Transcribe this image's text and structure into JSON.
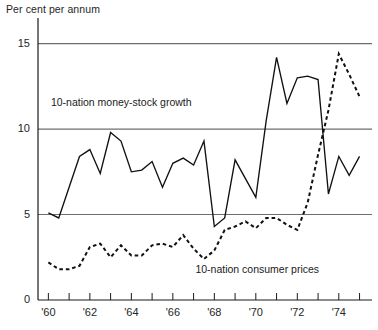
{
  "chart_data": {
    "type": "line",
    "title": "",
    "ylabel": "Per cent per annum",
    "xlabel": "",
    "ylim": [
      0,
      16.5
    ],
    "xlim": [
      1959.5,
      1975.6
    ],
    "grid": "horizontal gridlines at 5, 10, 15",
    "yticks": [
      0,
      5,
      10,
      15
    ],
    "yticklabels": [
      "0",
      "5",
      "10",
      "15"
    ],
    "xticks": [
      1960,
      1961,
      1962,
      1963,
      1964,
      1965,
      1966,
      1967,
      1968,
      1969,
      1970,
      1971,
      1972,
      1973,
      1974,
      1975
    ],
    "xticklabels": [
      "'60",
      "",
      "'62",
      "",
      "'64",
      "",
      "'66",
      "",
      "'68",
      "",
      "'70",
      "",
      "'72",
      "",
      "'74",
      ""
    ],
    "legend_position": "inline annotations",
    "series": [
      {
        "name": "10-nation money-stock growth",
        "style": "solid",
        "label_x": 1963.4,
        "label_y": 11.5,
        "x": [
          1960.0,
          1960.5,
          1961.0,
          1961.5,
          1962.0,
          1962.5,
          1963.0,
          1963.5,
          1964.0,
          1964.5,
          1965.0,
          1965.5,
          1966.0,
          1966.5,
          1967.0,
          1967.5,
          1968.0,
          1968.5,
          1969.0,
          1969.5,
          1970.0,
          1970.5,
          1971.0,
          1971.5,
          1972.0,
          1972.5,
          1973.0,
          1973.5,
          1974.0,
          1974.5,
          1975.0
        ],
        "values": [
          5.1,
          4.8,
          6.6,
          8.4,
          8.8,
          7.4,
          9.8,
          9.3,
          7.5,
          7.6,
          8.1,
          6.6,
          8.0,
          8.3,
          7.9,
          9.3,
          4.3,
          4.8,
          8.2,
          7.1,
          6.0,
          10.5,
          14.2,
          11.5,
          13.0,
          13.1,
          12.9,
          6.2,
          8.4,
          7.3,
          8.4
        ]
      },
      {
        "name": "10-nation consumer prices",
        "style": "dashed",
        "label_x": 1969.4,
        "label_y": 1.75,
        "x": [
          1960.0,
          1960.5,
          1961.0,
          1961.5,
          1962.0,
          1962.5,
          1963.0,
          1963.5,
          1964.0,
          1964.5,
          1965.0,
          1965.5,
          1966.0,
          1966.5,
          1967.0,
          1967.5,
          1968.0,
          1968.5,
          1969.0,
          1969.5,
          1970.0,
          1970.5,
          1971.0,
          1971.5,
          1972.0,
          1972.5,
          1973.0,
          1973.5,
          1974.0,
          1974.5,
          1975.0
        ],
        "values": [
          2.2,
          1.8,
          1.8,
          2.0,
          3.1,
          3.3,
          2.5,
          3.2,
          2.6,
          2.6,
          3.2,
          3.3,
          3.1,
          3.8,
          3.0,
          2.4,
          2.9,
          4.1,
          4.3,
          4.6,
          4.2,
          4.8,
          4.8,
          4.4,
          4.1,
          5.7,
          8.5,
          11.1,
          14.4,
          13.2,
          11.9
        ]
      }
    ]
  }
}
